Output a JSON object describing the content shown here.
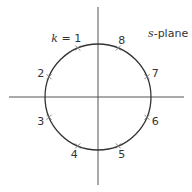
{
  "diagram": {
    "title": "s-plane",
    "title_var": "s",
    "title_rest": "-plane",
    "k_prefix": "k = ",
    "center": [
      98,
      97
    ],
    "radius": 53,
    "colors": {
      "stroke": "#333333",
      "axis": "#555555",
      "marker": "#777777"
    },
    "points": [
      {
        "label": "1",
        "angle_deg": 112.5
      },
      {
        "label": "2",
        "angle_deg": 157.5
      },
      {
        "label": "3",
        "angle_deg": 202.5
      },
      {
        "label": "4",
        "angle_deg": 247.5
      },
      {
        "label": "5",
        "angle_deg": 292.5
      },
      {
        "label": "6",
        "angle_deg": 337.5
      },
      {
        "label": "7",
        "angle_deg": 22.5
      },
      {
        "label": "8",
        "angle_deg": 67.5
      }
    ]
  }
}
